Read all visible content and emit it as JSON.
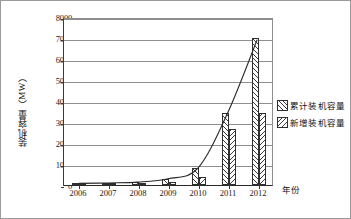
{
  "chart_data": {
    "type": "bar",
    "title": "",
    "xlabel": "年份",
    "ylabel": "装机容量（MW）",
    "categories": [
      "2006",
      "2007",
      "2008",
      "2009",
      "2010",
      "2011",
      "2012"
    ],
    "series": [
      {
        "name": "累计装机容量",
        "values": [
          80,
          100,
          140,
          300,
          800,
          3450,
          7000
        ],
        "hatch": "forward-diagonal"
      },
      {
        "name": "新增装机容量",
        "values": [
          10,
          20,
          40,
          160,
          400,
          2650,
          3450
        ],
        "hatch": "backward-diagonal"
      }
    ],
    "overlay_line": {
      "name": "累计装机容量趋势线",
      "values": [
        80,
        100,
        140,
        300,
        800,
        3450,
        7000
      ]
    },
    "ylim": [
      0,
      8000
    ],
    "yticks": [
      "0",
      "1000",
      "2000",
      "3000",
      "4000",
      "5000",
      "6000",
      "7000",
      "8000"
    ],
    "ytick_values": [
      0,
      1000,
      2000,
      3000,
      4000,
      5000,
      6000,
      7000,
      8000
    ],
    "grid": true,
    "grid_axis": "y",
    "legend_position": "right-outside",
    "line_color": "#2a2a2a",
    "bar_edge_color": "#2f2f2f",
    "grid_color": "#8f8f8f"
  },
  "legend": {
    "entries": [
      {
        "label": "累计装机容量"
      },
      {
        "label": "新增装机容量"
      }
    ]
  }
}
